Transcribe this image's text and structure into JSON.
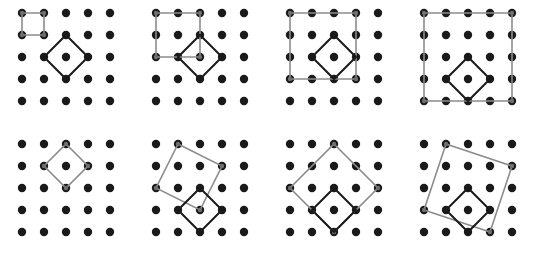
{
  "figure": {
    "title": "",
    "background_color": "#ffffff",
    "panel_count": 8,
    "panel_width": 134,
    "panel_height": 131,
    "columns": 4,
    "rows": 2
  },
  "lattice": {
    "name": "square-dot-lattice",
    "rows": 5,
    "cols": 5,
    "origin_x": 22,
    "origin_y": 13,
    "spacing": 22,
    "dot_radius": 4.2,
    "dot_color": "#1a1a1a"
  },
  "style": {
    "gray_stroke": "#8c8c8c",
    "gray_stroke_width": 1.6,
    "black_stroke": "#1a1a1a",
    "black_stroke_width": 2.0,
    "fill": "none",
    "vertex_marker_color": "#6f6f6f",
    "vertex_marker_radius": 2.2
  },
  "chart_data": {
    "type": "diagram",
    "panels": [
      {
        "index": 1,
        "position": {
          "row": 0,
          "col": 0
        },
        "shapes": [
          {
            "name": "gray-square",
            "color": "#8c8c8c",
            "vertices": [
              [
                0,
                0
              ],
              [
                1,
                0
              ],
              [
                1,
                1
              ],
              [
                0,
                1
              ]
            ],
            "edge_vector": [
              1,
              0
            ],
            "area_units": 1
          },
          {
            "name": "black-diamond",
            "color": "#1a1a1a",
            "vertices": [
              [
                2,
                1
              ],
              [
                3,
                2
              ],
              [
                2,
                3
              ],
              [
                1,
                2
              ]
            ],
            "edge_vector": [
              1,
              1
            ],
            "area_units": 2
          }
        ]
      },
      {
        "index": 2,
        "position": {
          "row": 0,
          "col": 1
        },
        "shapes": [
          {
            "name": "gray-square",
            "color": "#8c8c8c",
            "vertices": [
              [
                0,
                0
              ],
              [
                2,
                0
              ],
              [
                2,
                2
              ],
              [
                0,
                2
              ]
            ],
            "edge_vector": [
              2,
              0
            ],
            "area_units": 4
          },
          {
            "name": "black-diamond",
            "color": "#1a1a1a",
            "vertices": [
              [
                2,
                1
              ],
              [
                3,
                2
              ],
              [
                2,
                3
              ],
              [
                1,
                2
              ]
            ],
            "edge_vector": [
              1,
              1
            ],
            "area_units": 2
          }
        ]
      },
      {
        "index": 3,
        "position": {
          "row": 0,
          "col": 2
        },
        "shapes": [
          {
            "name": "gray-square",
            "color": "#8c8c8c",
            "vertices": [
              [
                0,
                0
              ],
              [
                3,
                0
              ],
              [
                3,
                3
              ],
              [
                0,
                3
              ]
            ],
            "edge_vector": [
              3,
              0
            ],
            "area_units": 9
          },
          {
            "name": "black-diamond",
            "color": "#1a1a1a",
            "vertices": [
              [
                2,
                1
              ],
              [
                3,
                2
              ],
              [
                2,
                3
              ],
              [
                1,
                2
              ]
            ],
            "edge_vector": [
              1,
              1
            ],
            "area_units": 2
          }
        ]
      },
      {
        "index": 4,
        "position": {
          "row": 0,
          "col": 3
        },
        "shapes": [
          {
            "name": "gray-square",
            "color": "#8c8c8c",
            "vertices": [
              [
                0,
                0
              ],
              [
                4,
                0
              ],
              [
                4,
                4
              ],
              [
                0,
                4
              ]
            ],
            "edge_vector": [
              4,
              0
            ],
            "area_units": 16
          },
          {
            "name": "black-diamond",
            "color": "#1a1a1a",
            "vertices": [
              [
                2,
                2
              ],
              [
                3,
                3
              ],
              [
                2,
                4
              ],
              [
                1,
                3
              ]
            ],
            "edge_vector": [
              1,
              1
            ],
            "area_units": 2
          }
        ]
      },
      {
        "index": 5,
        "position": {
          "row": 1,
          "col": 0
        },
        "shapes": [
          {
            "name": "gray-diamond",
            "color": "#8c8c8c",
            "vertices": [
              [
                2,
                0
              ],
              [
                3,
                1
              ],
              [
                2,
                2
              ],
              [
                1,
                1
              ]
            ],
            "edge_vector": [
              1,
              1
            ],
            "area_units": 2
          }
        ]
      },
      {
        "index": 6,
        "position": {
          "row": 1,
          "col": 1
        },
        "shapes": [
          {
            "name": "gray-tilted-square",
            "color": "#8c8c8c",
            "vertices": [
              [
                1,
                0
              ],
              [
                3,
                1
              ],
              [
                2,
                3
              ],
              [
                0,
                2
              ]
            ],
            "edge_vector": [
              2,
              1
            ],
            "area_units": 5
          },
          {
            "name": "black-diamond",
            "color": "#1a1a1a",
            "vertices": [
              [
                2,
                2
              ],
              [
                3,
                3
              ],
              [
                2,
                4
              ],
              [
                1,
                3
              ]
            ],
            "edge_vector": [
              1,
              1
            ],
            "area_units": 2
          }
        ]
      },
      {
        "index": 7,
        "position": {
          "row": 1,
          "col": 2
        },
        "shapes": [
          {
            "name": "gray-tilted-square",
            "color": "#8c8c8c",
            "vertices": [
              [
                2,
                0
              ],
              [
                4,
                2
              ],
              [
                2,
                4
              ],
              [
                0,
                2
              ]
            ],
            "edge_vector": [
              2,
              2
            ],
            "area_units": 8
          },
          {
            "name": "black-diamond",
            "color": "#1a1a1a",
            "vertices": [
              [
                2,
                2
              ],
              [
                3,
                3
              ],
              [
                2,
                4
              ],
              [
                1,
                3
              ]
            ],
            "edge_vector": [
              1,
              1
            ],
            "area_units": 2
          }
        ]
      },
      {
        "index": 8,
        "position": {
          "row": 1,
          "col": 3
        },
        "shapes": [
          {
            "name": "gray-tilted-square",
            "color": "#8c8c8c",
            "vertices": [
              [
                1,
                0
              ],
              [
                4,
                1
              ],
              [
                3,
                4
              ],
              [
                0,
                3
              ]
            ],
            "edge_vector": [
              3,
              1
            ],
            "area_units": 10
          },
          {
            "name": "black-diamond",
            "color": "#1a1a1a",
            "vertices": [
              [
                2,
                2
              ],
              [
                3,
                3
              ],
              [
                2,
                4
              ],
              [
                1,
                3
              ]
            ],
            "edge_vector": [
              1,
              1
            ],
            "area_units": 2
          }
        ]
      }
    ]
  }
}
